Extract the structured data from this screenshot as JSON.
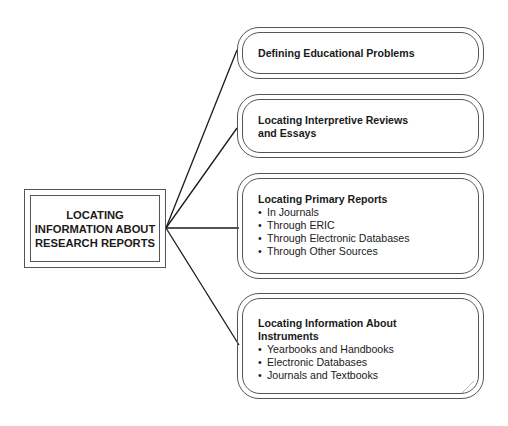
{
  "diagram": {
    "type": "concept-map",
    "center": {
      "lines": [
        "LOCATING",
        "INFORMATION ABOUT",
        "RESEARCH REPORTS"
      ]
    },
    "branches": [
      {
        "title_lines": [
          "Defining Educational Problems"
        ],
        "items": []
      },
      {
        "title_lines": [
          "Locating Interpretive Reviews",
          "and Essays"
        ],
        "items": []
      },
      {
        "title_lines": [
          "Locating Primary Reports"
        ],
        "items": [
          "In Journals",
          "Through ERIC",
          "Through Electronic Databases",
          "Through Other Sources"
        ]
      },
      {
        "title_lines": [
          "Locating Information About",
          "Instruments"
        ],
        "items": [
          "Yearbooks and Handbooks",
          "Electronic Databases",
          "Journals and Textbooks"
        ]
      }
    ],
    "colors": {
      "line": "#1a1a1a",
      "border": "#555555",
      "text": "#1a1a1a",
      "background": "#ffffff"
    }
  }
}
